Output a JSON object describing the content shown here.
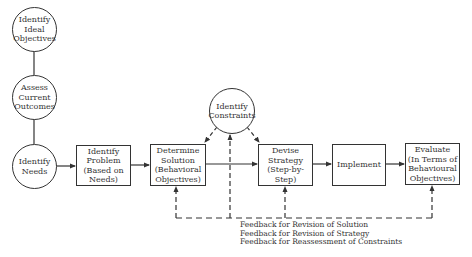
{
  "diagram": {
    "type": "flowchart",
    "circles": [
      {
        "id": "ideal",
        "label": "Identify\nIdeal\nObjectives"
      },
      {
        "id": "assess",
        "label": "Assess\nCurrent\nOutcomes"
      },
      {
        "id": "needs",
        "label": "Identify\nNeeds"
      },
      {
        "id": "constraints",
        "label": "Identify\nConstraints"
      }
    ],
    "boxes": [
      {
        "id": "problem",
        "label": "Identify\nProblem\n(Based on\nNeeds)"
      },
      {
        "id": "solution",
        "label": "Determine\nSolution\n(Behavioral\nObjectives)"
      },
      {
        "id": "strategy",
        "label": "Devise\nStrategy\n(Step-by-Step)"
      },
      {
        "id": "implement",
        "label": "Implement"
      },
      {
        "id": "evaluate",
        "label": "Evaluate\n(In Terms of\nBehavioural\nObjectives)"
      }
    ],
    "feedback_text": "Feedback for Revision of Solution\nFeedback for Revision of Strategy\nFeedback for Reassessment of Constraints",
    "edges": [
      {
        "from": "ideal",
        "to": "assess",
        "style": "solid",
        "arrow": false
      },
      {
        "from": "assess",
        "to": "needs",
        "style": "solid",
        "arrow": false
      },
      {
        "from": "needs",
        "to": "problem",
        "style": "solid",
        "arrow": true
      },
      {
        "from": "problem",
        "to": "solution",
        "style": "solid",
        "arrow": true
      },
      {
        "from": "solution",
        "to": "strategy",
        "style": "solid",
        "arrow": true
      },
      {
        "from": "strategy",
        "to": "implement",
        "style": "solid",
        "arrow": true
      },
      {
        "from": "implement",
        "to": "evaluate",
        "style": "solid",
        "arrow": true
      },
      {
        "from": "constraints",
        "to": "solution",
        "style": "dashed",
        "arrow": true
      },
      {
        "from": "constraints",
        "to": "strategy",
        "style": "dashed",
        "arrow": true
      },
      {
        "from": "evaluate",
        "to": "solution",
        "style": "dashed",
        "arrow": true,
        "label": "Feedback for Revision of Solution"
      },
      {
        "from": "evaluate",
        "to": "strategy",
        "style": "dashed",
        "arrow": true,
        "label": "Feedback for Revision of Strategy"
      },
      {
        "from": "evaluate",
        "to": "constraints",
        "style": "dashed",
        "arrow": true,
        "label": "Feedback for Reassessment of Constraints"
      }
    ]
  }
}
